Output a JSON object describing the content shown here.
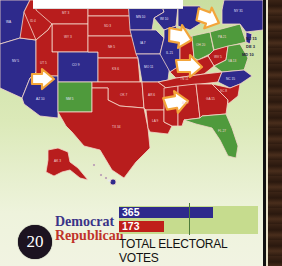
{
  "page": {
    "page_number": "20",
    "caption": "TOTAL ELECTORAL VOTES"
  },
  "legend": {
    "democrat_label": "Democrat",
    "republican_label": "Republican"
  },
  "colors": {
    "democrat": "#2f2a8c",
    "republican": "#c01f1a",
    "flipped": "#4f9a3c",
    "arrow": "#f3a53a",
    "background": "#dbe9b8"
  },
  "chart_data": {
    "type": "bar",
    "orientation": "horizontal",
    "title": "TOTAL ELECTORAL VOTES",
    "categories": [
      "Democrat",
      "Republican"
    ],
    "values": [
      365,
      173
    ],
    "value_labels": [
      "365",
      "173"
    ],
    "colors": [
      "#2f2a8c",
      "#c01f1a"
    ],
    "xlim": [
      0,
      538
    ],
    "threshold": 270,
    "grid": false,
    "legend_position": "left"
  },
  "map": {
    "states": [
      {
        "abbr": "WA",
        "ev": "11",
        "party": "D"
      },
      {
        "abbr": "OR",
        "ev": "7",
        "party": "D"
      },
      {
        "abbr": "CA",
        "ev": "55",
        "party": "D"
      },
      {
        "abbr": "NV",
        "ev": "5",
        "party": "D"
      },
      {
        "abbr": "ID",
        "ev": "4",
        "party": "R"
      },
      {
        "abbr": "MT",
        "ev": "3",
        "party": "R"
      },
      {
        "abbr": "WY",
        "ev": "3",
        "party": "R"
      },
      {
        "abbr": "UT",
        "ev": "5",
        "party": "R"
      },
      {
        "abbr": "AZ",
        "ev": "10",
        "party": "R"
      },
      {
        "abbr": "CO",
        "ev": "9",
        "party": "D"
      },
      {
        "abbr": "NM",
        "ev": "5",
        "party": "D",
        "flipped": true
      },
      {
        "abbr": "ND",
        "ev": "3",
        "party": "R"
      },
      {
        "abbr": "SD",
        "ev": "3",
        "party": "R"
      },
      {
        "abbr": "NE",
        "ev": "5",
        "party": "R"
      },
      {
        "abbr": "KS",
        "ev": "6",
        "party": "R"
      },
      {
        "abbr": "OK",
        "ev": "7",
        "party": "R"
      },
      {
        "abbr": "TX",
        "ev": "34",
        "party": "R"
      },
      {
        "abbr": "MN",
        "ev": "10",
        "party": "D"
      },
      {
        "abbr": "IA",
        "ev": "7",
        "party": "D"
      },
      {
        "abbr": "MO",
        "ev": "11",
        "party": "D"
      },
      {
        "abbr": "AR",
        "ev": "6",
        "party": "R"
      },
      {
        "abbr": "LA",
        "ev": "9",
        "party": "R"
      },
      {
        "abbr": "WI",
        "ev": "10",
        "party": "D"
      },
      {
        "abbr": "IL",
        "ev": "21",
        "party": "D"
      },
      {
        "abbr": "MI",
        "ev": "17",
        "party": "D"
      },
      {
        "abbr": "IN",
        "ev": "11",
        "party": "R"
      },
      {
        "abbr": "OH",
        "ev": "20",
        "party": "D",
        "flipped": true
      },
      {
        "abbr": "KY",
        "ev": "8",
        "party": "R"
      },
      {
        "abbr": "TN",
        "ev": "11",
        "party": "R"
      },
      {
        "abbr": "MS",
        "ev": "6",
        "party": "R"
      },
      {
        "abbr": "AL",
        "ev": "9",
        "party": "R"
      },
      {
        "abbr": "GA",
        "ev": "15",
        "party": "R"
      },
      {
        "abbr": "FL",
        "ev": "27",
        "party": "D",
        "flipped": true
      },
      {
        "abbr": "SC",
        "ev": "8",
        "party": "R"
      },
      {
        "abbr": "NC",
        "ev": "15",
        "party": "D"
      },
      {
        "abbr": "VA",
        "ev": "13",
        "party": "D",
        "flipped": true
      },
      {
        "abbr": "WV",
        "ev": "5",
        "party": "R"
      },
      {
        "abbr": "PA",
        "ev": "21",
        "party": "D",
        "flipped": true
      },
      {
        "abbr": "NY",
        "ev": "31",
        "party": "D"
      },
      {
        "abbr": "NJ",
        "ev": "15",
        "party": "D"
      },
      {
        "abbr": "DE",
        "ev": "3",
        "party": "D"
      },
      {
        "abbr": "MD",
        "ev": "10",
        "party": "D"
      },
      {
        "abbr": "AK",
        "ev": "3",
        "party": "R"
      },
      {
        "abbr": "HI",
        "ev": "4",
        "party": "D"
      }
    ],
    "side_labels": {
      "nj": "NJ 15",
      "de": "DE 3",
      "md": "MD 10"
    }
  }
}
